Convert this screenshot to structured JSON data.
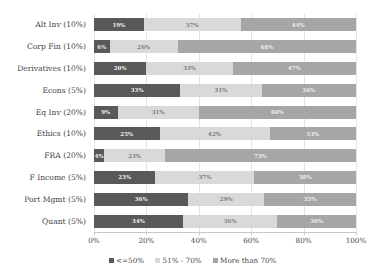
{
  "chart_data": {
    "type": "bar",
    "orientation": "horizontal",
    "stacked": true,
    "title": "",
    "xlabel": "",
    "ylabel": "",
    "xlim": [
      0,
      100
    ],
    "xticks": [
      "0%",
      "20%",
      "40%",
      "60%",
      "80%",
      "100%"
    ],
    "xtick_values": [
      0,
      20,
      40,
      60,
      80,
      100
    ],
    "grid": true,
    "legend_position": "bottom",
    "categories": [
      "Alt Inv (10%)",
      "Corp Fin (10%)",
      "Derivatives (10%)",
      "Econs (5%)",
      "Eq Inv (20%)",
      "Ethics (10%)",
      "FRA (20%)",
      "F Income (5%)",
      "Port Mgmt (5%)",
      "Quant (5%)"
    ],
    "series": [
      {
        "name": "<=50%",
        "color": "#595959",
        "values": [
          19,
          6,
          20,
          33,
          9,
          25,
          4,
          23,
          36,
          34
        ],
        "labels": [
          "19%",
          "6%",
          "20%",
          "33%",
          "9%",
          "25%",
          "4%",
          "23%",
          "36%",
          "34%"
        ]
      },
      {
        "name": "51% - 70%",
        "color": "#d9d9d9",
        "values": [
          37,
          26,
          33,
          31,
          31,
          42,
          23,
          37,
          29,
          36
        ],
        "labels": [
          "37%",
          "26%",
          "33%",
          "31%",
          "31%",
          "42%",
          "23%",
          "37%",
          "29%",
          "36%"
        ]
      },
      {
        "name": "More than 70%",
        "color": "#a6a6a6",
        "values": [
          44,
          68,
          47,
          36,
          60,
          33,
          73,
          38,
          35,
          30
        ],
        "labels": [
          "44%",
          "68%",
          "47%",
          "36%",
          "60%",
          "33%",
          "73%",
          "38%",
          "35%",
          "30%"
        ]
      }
    ]
  },
  "footer": {
    "copyright": "Copyright © 2019 300 Hours. All Rights Reserved"
  }
}
